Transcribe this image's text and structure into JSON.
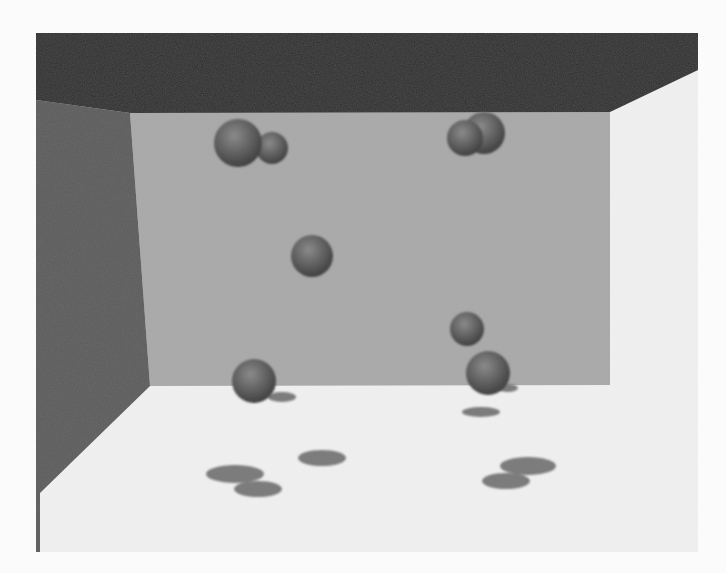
{
  "scene": {
    "description": "Grayscale 3D rendering of a room corner (ceiling, left wall, back wall, floor) with floating spheres casting shadows on the floor",
    "colors": {
      "page_background": "#fbfbfb",
      "floor": "#f1f1f1",
      "back_wall": "#a9a9a9",
      "left_wall": "#5b5b5b",
      "ceiling": "#2f2f2f",
      "sphere_light": "#8a8a8a",
      "sphere_dark": "#3c3c3c",
      "shadow": "#7c7c7c"
    },
    "surfaces": {
      "floor": "36,33 698,33 698,552 36,552",
      "back_wall": "130,113 610,112 610,385 150,386",
      "left_wall": "36,100 130,113 150,386 40,493 40,552 36,552",
      "ceiling": "36,33 698,33 698,70 610,112 130,113 36,100"
    },
    "spheres": [
      {
        "cx": 272,
        "cy": 148,
        "r": 16
      },
      {
        "cx": 238,
        "cy": 143,
        "r": 24
      },
      {
        "cx": 484,
        "cy": 133,
        "r": 21
      },
      {
        "cx": 465,
        "cy": 138,
        "r": 18
      },
      {
        "cx": 312,
        "cy": 256,
        "r": 21
      },
      {
        "cx": 467,
        "cy": 329,
        "r": 17
      },
      {
        "cx": 254,
        "cy": 381,
        "r": 22
      },
      {
        "cx": 488,
        "cy": 373,
        "r": 22
      }
    ],
    "shadows": [
      {
        "cx": 282,
        "cy": 397,
        "rx": 14,
        "ry": 5
      },
      {
        "cx": 508,
        "cy": 388,
        "rx": 10,
        "ry": 4
      },
      {
        "cx": 481,
        "cy": 412,
        "rx": 19,
        "ry": 5
      },
      {
        "cx": 322,
        "cy": 458,
        "rx": 24,
        "ry": 8
      },
      {
        "cx": 235,
        "cy": 474,
        "rx": 29,
        "ry": 9
      },
      {
        "cx": 258,
        "cy": 489,
        "rx": 24,
        "ry": 8
      },
      {
        "cx": 528,
        "cy": 466,
        "rx": 28,
        "ry": 9
      },
      {
        "cx": 506,
        "cy": 481,
        "rx": 24,
        "ry": 8
      }
    ]
  }
}
